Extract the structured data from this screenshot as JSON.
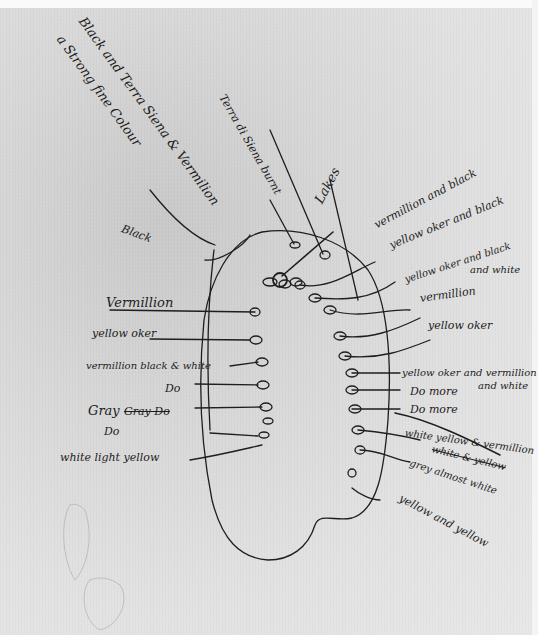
{
  "document": {
    "type": "hand-drawn palette sketch with color annotations",
    "ink_color": "#1c1c1c",
    "paper_color": "#e2e2e2"
  },
  "top_notes": {
    "line1": "Black and Terra Siena & Vermilion",
    "line2": "a Strong fine Colour",
    "center": "Terra di Siena burnt",
    "lakes": "Lakes",
    "black": "Black"
  },
  "left_labels": [
    "Vermillion",
    "yellow oker",
    "vermillion black & white",
    "Do",
    "Gray",
    "Gray Do",
    "Do",
    "white light yellow"
  ],
  "right_labels": [
    "vermillion and black",
    "yellow oker and black",
    "yellow oker and black",
    "and white",
    "vermillion",
    "yellow oker",
    "yellow oker and vermillion",
    "Do more",
    "and white",
    "Do more",
    "white yellow & vermillion",
    "white & yellow",
    "grey almost white",
    "yellow and yellow"
  ]
}
